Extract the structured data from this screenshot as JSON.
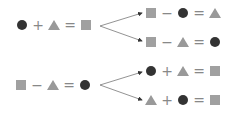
{
  "colors": {
    "circle": "#333333",
    "square": "#a0a0a0",
    "triangle": "#999999",
    "operator": "#888888",
    "arrow": "#555555"
  },
  "groups": [
    {
      "source": [
        "circle",
        "+",
        "triangle",
        "=",
        "square"
      ],
      "targets": [
        [
          "square",
          "−",
          "circle",
          "=",
          "triangle"
        ],
        [
          "square",
          "−",
          "triangle",
          "=",
          "circle"
        ]
      ]
    },
    {
      "source": [
        "square",
        "−",
        "triangle",
        "=",
        "circle"
      ],
      "targets": [
        [
          "circle",
          "+",
          "triangle",
          "=",
          "square"
        ],
        [
          "triangle",
          "+",
          "circle",
          "=",
          "square"
        ]
      ]
    }
  ]
}
